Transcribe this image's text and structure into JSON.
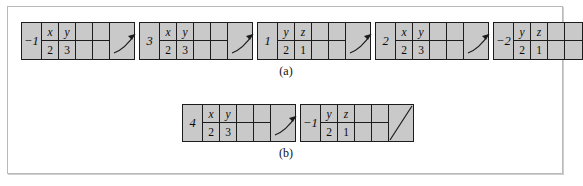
{
  "figure": {
    "background": "#ffffff",
    "node_fill": "#c9c9c9",
    "stroke": "#1c1c1c",
    "frame_border": "#b9b9b9",
    "captions": {
      "a": "(a)",
      "b": "(b)"
    }
  },
  "rows": [
    {
      "id": "row-a",
      "caption": "(a)",
      "nodes": [
        {
          "key": "−1",
          "pairs": [
            {
              "var": "x",
              "val": "2"
            },
            {
              "var": "y",
              "val": "3"
            }
          ],
          "empty_cells": 2,
          "pointer": "arrow"
        },
        {
          "key": "3",
          "pairs": [
            {
              "var": "x",
              "val": "2"
            },
            {
              "var": "y",
              "val": "3"
            }
          ],
          "empty_cells": 2,
          "pointer": "arrow"
        },
        {
          "key": "1",
          "pairs": [
            {
              "var": "y",
              "val": "2"
            },
            {
              "var": "z",
              "val": "1"
            }
          ],
          "empty_cells": 2,
          "pointer": "arrow"
        },
        {
          "key": "2",
          "pairs": [
            {
              "var": "x",
              "val": "2"
            },
            {
              "var": "y",
              "val": "3"
            }
          ],
          "empty_cells": 2,
          "pointer": "arrow"
        },
        {
          "key": "−2",
          "pairs": [
            {
              "var": "y",
              "val": "2"
            },
            {
              "var": "z",
              "val": "1"
            }
          ],
          "empty_cells": 2,
          "pointer": "none"
        }
      ]
    },
    {
      "id": "row-b",
      "caption": "(b)",
      "nodes": [
        {
          "key": "4",
          "pairs": [
            {
              "var": "x",
              "val": "2"
            },
            {
              "var": "y",
              "val": "3"
            }
          ],
          "empty_cells": 2,
          "pointer": "arrow"
        },
        {
          "key": "−1",
          "pairs": [
            {
              "var": "y",
              "val": "2"
            },
            {
              "var": "z",
              "val": "1"
            }
          ],
          "empty_cells": 2,
          "pointer": "null-slash"
        }
      ]
    }
  ]
}
